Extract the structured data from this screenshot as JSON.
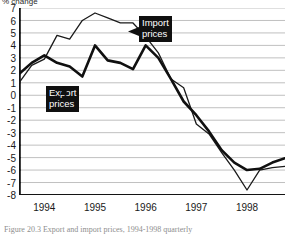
{
  "figure": {
    "y_axis_title": "% change",
    "caption": "Figure 20.3  Export and import prices, 1994-1998 quarterly"
  },
  "callouts": {
    "import": {
      "line1": "Import",
      "line2": "prices"
    },
    "export": {
      "line1": "Export",
      "line2": "prices"
    }
  },
  "chart_data": {
    "type": "line",
    "title": "",
    "subtitle": "",
    "xlabel": "",
    "ylabel": "% change",
    "ylim": [
      -8,
      7
    ],
    "xlim": [
      0,
      21
    ],
    "grid": true,
    "gridlines": "horizontal at every integer from -8 to 7",
    "legend_position": "inline-callouts",
    "y_ticks": [
      7,
      6,
      5,
      4,
      3,
      2,
      1,
      0,
      -1,
      -2,
      -3,
      -4,
      -5,
      -6,
      -7,
      -8
    ],
    "y_tick_labels": [
      "7",
      "6",
      "5",
      "4",
      "3",
      "2",
      "1",
      "0",
      "-1",
      "-2",
      "-3",
      "-4",
      "-5",
      "-6",
      "-7",
      "-8"
    ],
    "x_tick_labels": [
      "1994",
      "1995",
      "1996",
      "1997",
      "1998"
    ],
    "x_tick_positions": [
      2.0,
      6.0,
      10.0,
      14.0,
      18.0
    ],
    "x_minor_ticks": "quarterly",
    "x": [
      0,
      1,
      2,
      3,
      4,
      5,
      6,
      7,
      8,
      9,
      10,
      11,
      12,
      13,
      14,
      15,
      16,
      17,
      18,
      19,
      20,
      21
    ],
    "series": [
      {
        "name": "Import prices",
        "style": "thin",
        "color": "#1a1a1a",
        "values": [
          1.0,
          2.4,
          2.9,
          4.8,
          4.5,
          6.0,
          6.6,
          6.2,
          5.8,
          5.8,
          4.7,
          3.4,
          1.3,
          0.6,
          -2.3,
          -3.1,
          -4.6,
          -6.0,
          -7.6,
          -6.0,
          -5.8,
          -5.7
        ]
      },
      {
        "name": "Export prices",
        "style": "thick",
        "color": "#101010",
        "values": [
          1.7,
          2.6,
          3.2,
          2.6,
          2.3,
          1.5,
          4.0,
          2.8,
          2.6,
          2.1,
          4.0,
          3.0,
          1.3,
          -0.5,
          -1.6,
          -2.9,
          -4.4,
          -5.4,
          -6.0,
          -5.9,
          -5.4,
          -5.05
        ]
      }
    ],
    "annotations": [
      {
        "text": "Import prices",
        "target_series": "Import prices",
        "x": 9.0
      },
      {
        "text": "Export prices",
        "target_series": "Export prices",
        "x": 4.0
      }
    ]
  }
}
